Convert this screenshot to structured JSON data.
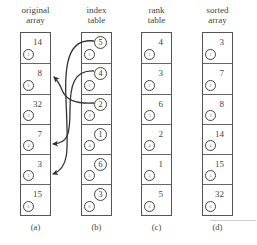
{
  "columns": [
    {
      "id": "original",
      "header": [
        "original",
        "array"
      ],
      "caption": "(a)",
      "kind": "values",
      "cells": [
        {
          "index": "1",
          "value": "14"
        },
        {
          "index": "2",
          "value": "8"
        },
        {
          "index": "3",
          "value": "32"
        },
        {
          "index": "4",
          "value": "7"
        },
        {
          "index": "5",
          "value": "3"
        },
        {
          "index": "6",
          "value": "15"
        }
      ]
    },
    {
      "id": "index",
      "header": [
        "index",
        "table"
      ],
      "caption": "(b)",
      "kind": "pointers",
      "cells": [
        {
          "index": "1",
          "value": "5"
        },
        {
          "index": "2",
          "value": "4"
        },
        {
          "index": "3",
          "value": "2"
        },
        {
          "index": "4",
          "value": "1"
        },
        {
          "index": "5",
          "value": "6"
        },
        {
          "index": "6",
          "value": "3"
        }
      ]
    },
    {
      "id": "rank",
      "header": [
        "rank",
        "table"
      ],
      "caption": "(c)",
      "kind": "values",
      "cells": [
        {
          "index": "1",
          "value": "4"
        },
        {
          "index": "2",
          "value": "3"
        },
        {
          "index": "3",
          "value": "6"
        },
        {
          "index": "4",
          "value": "2"
        },
        {
          "index": "5",
          "value": "1"
        },
        {
          "index": "6",
          "value": "5"
        }
      ]
    },
    {
      "id": "sorted",
      "header": [
        "sorted",
        "array"
      ],
      "caption": "(d)",
      "kind": "values",
      "cells": [
        {
          "index": "1",
          "value": "3"
        },
        {
          "index": "2",
          "value": "7"
        },
        {
          "index": "3",
          "value": "8"
        },
        {
          "index": "4",
          "value": "14"
        },
        {
          "index": "5",
          "value": "15"
        },
        {
          "index": "6",
          "value": "32"
        }
      ]
    }
  ],
  "arrows": [
    {
      "from": "index[1]=5",
      "to": "original[5]"
    },
    {
      "from": "index[2]=4",
      "to": "original[4]"
    },
    {
      "from": "index[3]=2",
      "to": "original[2]"
    }
  ],
  "colors": {
    "line": "#3a3a3a",
    "text": "#444444",
    "background": "#ffffff"
  }
}
